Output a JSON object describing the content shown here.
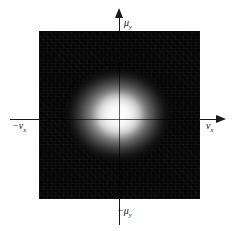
{
  "figure": {
    "name": "spatial-frequency-intensity-plot",
    "background_color": "#ffffff",
    "field_color": "#050505",
    "blob_color": "#ffffff",
    "axis_color": "#1a1a1a"
  },
  "axes": {
    "vertical_positive": {
      "symbol": "μ",
      "subscript": "y",
      "sign": "",
      "text": "μ"
    },
    "vertical_negative": {
      "symbol": "μ",
      "subscript": "y",
      "sign": "−",
      "text": "−μ"
    },
    "horizontal_negative": {
      "symbol": "ν",
      "subscript": "x",
      "sign": "−",
      "text": "−ν"
    },
    "horizontal_positive": {
      "symbol": "ν",
      "subscript": "x",
      "sign": "",
      "text": "ν"
    }
  },
  "chart_data": {
    "type": "heatmap",
    "title": "",
    "subtitle": "",
    "xlabel": "ν_x",
    "ylabel": "μ_y",
    "legend": [],
    "grid": false,
    "annotations": [
      "μ_y",
      "−μ_y",
      "−ν_x",
      "ν_x"
    ],
    "xlim": [
      -1,
      1
    ],
    "ylim": [
      -1,
      1
    ],
    "colormap": "grayscale",
    "peak": {
      "x": 0.0,
      "y": 0.0,
      "value": 1.0
    },
    "sigma": {
      "x": 0.2,
      "y": 0.17
    },
    "x": [
      -1.0,
      -0.8,
      -0.6,
      -0.4,
      -0.2,
      0.0,
      0.2,
      0.4,
      0.6,
      0.8,
      1.0
    ],
    "y": [
      -1.0,
      -0.8,
      -0.6,
      -0.4,
      -0.2,
      0.0,
      0.2,
      0.4,
      0.6,
      0.8,
      1.0
    ],
    "values": [
      [
        0.0,
        0.0,
        0.0,
        0.0,
        0.0,
        0.0,
        0.0,
        0.0,
        0.0,
        0.0,
        0.0
      ],
      [
        0.0,
        0.0,
        0.0,
        0.0,
        0.0,
        0.0,
        0.0,
        0.0,
        0.0,
        0.0,
        0.0
      ],
      [
        0.0,
        0.0,
        0.0,
        0.0,
        0.01,
        0.01,
        0.01,
        0.0,
        0.0,
        0.0,
        0.0
      ],
      [
        0.0,
        0.0,
        0.0,
        0.02,
        0.08,
        0.12,
        0.08,
        0.02,
        0.0,
        0.0,
        0.0
      ],
      [
        0.0,
        0.0,
        0.01,
        0.12,
        0.45,
        0.62,
        0.45,
        0.12,
        0.01,
        0.0,
        0.0
      ],
      [
        0.0,
        0.0,
        0.02,
        0.2,
        0.72,
        1.0,
        0.72,
        0.2,
        0.02,
        0.0,
        0.0
      ],
      [
        0.0,
        0.0,
        0.01,
        0.14,
        0.5,
        0.68,
        0.5,
        0.14,
        0.01,
        0.0,
        0.0
      ],
      [
        0.0,
        0.0,
        0.0,
        0.03,
        0.1,
        0.15,
        0.1,
        0.03,
        0.0,
        0.0,
        0.0
      ],
      [
        0.0,
        0.0,
        0.0,
        0.0,
        0.01,
        0.01,
        0.01,
        0.0,
        0.0,
        0.0,
        0.0
      ],
      [
        0.0,
        0.0,
        0.0,
        0.0,
        0.0,
        0.0,
        0.0,
        0.0,
        0.0,
        0.0,
        0.0
      ],
      [
        0.0,
        0.0,
        0.0,
        0.0,
        0.0,
        0.0,
        0.0,
        0.0,
        0.0,
        0.0,
        0.0
      ]
    ]
  }
}
